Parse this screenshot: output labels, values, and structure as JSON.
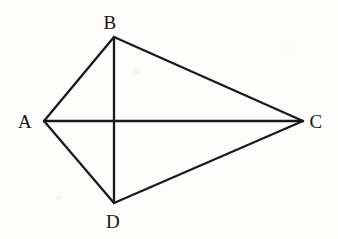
{
  "figure": {
    "background_color": "#fdfdfc",
    "stroke_color": "#1a1a1a",
    "label_color": "#141414",
    "stroke_width": 2.3,
    "canvas": {
      "width": 338,
      "height": 239
    },
    "vertices": [
      {
        "id": "A",
        "label": "A",
        "x": 44,
        "y": 121,
        "label_x": 25,
        "label_y": 121
      },
      {
        "id": "B",
        "label": "B",
        "x": 114,
        "y": 37,
        "label_x": 110,
        "label_y": 22
      },
      {
        "id": "C",
        "label": "C",
        "x": 303,
        "y": 121,
        "label_x": 316,
        "label_y": 121
      },
      {
        "id": "D",
        "label": "D",
        "x": 114,
        "y": 203,
        "label_x": 113,
        "label_y": 221
      }
    ],
    "edges": [
      {
        "id": "AB",
        "from": "A",
        "to": "B",
        "kind": "side"
      },
      {
        "id": "BC",
        "from": "B",
        "to": "C",
        "kind": "side"
      },
      {
        "id": "CD",
        "from": "C",
        "to": "D",
        "kind": "side"
      },
      {
        "id": "DA",
        "from": "D",
        "to": "A",
        "kind": "side"
      },
      {
        "id": "AC",
        "from": "A",
        "to": "C",
        "kind": "diagonal"
      },
      {
        "id": "BD",
        "from": "B",
        "to": "D",
        "kind": "diagonal"
      }
    ],
    "intersection": {
      "id": "O",
      "x": 114,
      "y": 121,
      "label": ""
    }
  }
}
